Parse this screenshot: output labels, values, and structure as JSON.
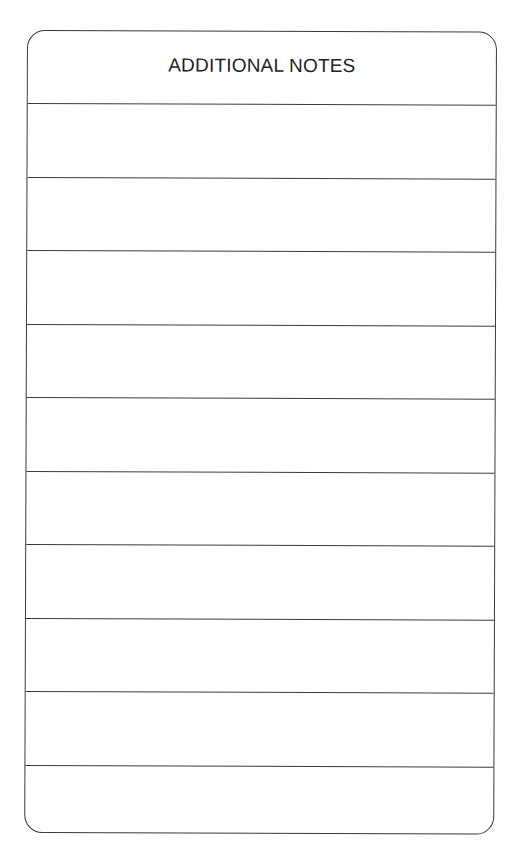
{
  "form": {
    "title": "ADDITIONAL NOTES",
    "rows": [
      {
        "text": ""
      },
      {
        "text": ""
      },
      {
        "text": ""
      },
      {
        "text": ""
      },
      {
        "text": ""
      },
      {
        "text": ""
      },
      {
        "text": ""
      },
      {
        "text": ""
      },
      {
        "text": ""
      },
      {
        "text": ""
      }
    ],
    "colors": {
      "border": "#3a3a3a",
      "text": "#222222",
      "background": "#ffffff"
    }
  }
}
